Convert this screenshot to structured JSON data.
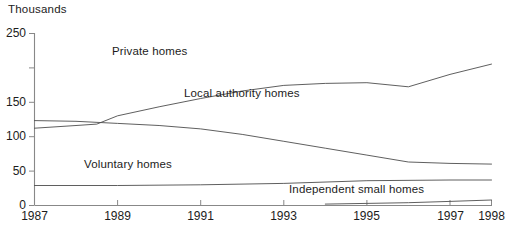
{
  "chart_data": {
    "type": "line",
    "title": "",
    "ylabel": "Thousands",
    "xlabel": "",
    "ylim": [
      0,
      250
    ],
    "xlim": [
      1987,
      1998
    ],
    "grid": false,
    "legend_position": "inline-labels",
    "y_ticks": [
      0,
      50,
      100,
      150,
      200,
      250
    ],
    "y_tick_labels": [
      "0",
      "50",
      "100",
      "150",
      "",
      "250"
    ],
    "x_ticks": [
      1987,
      1989,
      1991,
      1993,
      1995,
      1997,
      1998
    ],
    "x_tick_labels": [
      "1987",
      "1989",
      "1991",
      "1993",
      "1995",
      "1997",
      "1998"
    ],
    "series": [
      {
        "name": "Private homes",
        "x": [
          1987,
          1988,
          1988.5,
          1989,
          1990,
          1991,
          1992,
          1993,
          1994,
          1995,
          1996,
          1997,
          1998
        ],
        "values": [
          112,
          116,
          118,
          130,
          143,
          155,
          166,
          174,
          177,
          178,
          172,
          190,
          205
        ]
      },
      {
        "name": "Local authority homes",
        "x": [
          1987,
          1988,
          1989,
          1990,
          1991,
          1992,
          1993,
          1994,
          1995,
          1996,
          1997,
          1998
        ],
        "values": [
          123,
          122,
          119,
          116,
          111,
          103,
          93,
          83,
          73,
          63,
          61,
          60
        ]
      },
      {
        "name": "Voluntary homes",
        "x": [
          1987,
          1989,
          1991,
          1993,
          1995,
          1997,
          1998
        ],
        "values": [
          29,
          29,
          30,
          32,
          36,
          37,
          37
        ]
      },
      {
        "name": "Independent small homes",
        "x": [
          1994,
          1995,
          1996,
          1997,
          1998
        ],
        "values": [
          2,
          3,
          4,
          6,
          8
        ]
      }
    ],
    "series_labels": [
      {
        "text": "Private homes",
        "x_px": 112,
        "y_px": 52
      },
      {
        "text": "Local authority homes",
        "x_px": 184,
        "y_px": 94
      },
      {
        "text": "Voluntary homes",
        "x_px": 84,
        "y_px": 165
      },
      {
        "text": "Independent small homes",
        "x_px": 289,
        "y_px": 190
      }
    ]
  }
}
